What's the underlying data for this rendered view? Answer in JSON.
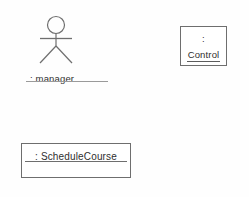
{
  "diagram": {
    "type": "uml-object-diagram",
    "background_color": "#fefefe",
    "line_color": "#6e6e6e",
    "text_color": "#2f2f2f",
    "width": 249,
    "height": 197
  },
  "actor": {
    "icon": "stick-figure-actor-icon",
    "label": ": manager",
    "role_name": "manager",
    "instance_name": "",
    "underlined": true
  },
  "control_object": {
    "colon": ":",
    "label": "Control",
    "instance_name": "",
    "class_name": "Control",
    "underlined": true,
    "compartments": 1
  },
  "schedule_object": {
    "label": ": ScheduleCourse",
    "instance_name": "",
    "class_name": "ScheduleCourse",
    "underlined": true,
    "attributes": [],
    "compartments": 2
  }
}
